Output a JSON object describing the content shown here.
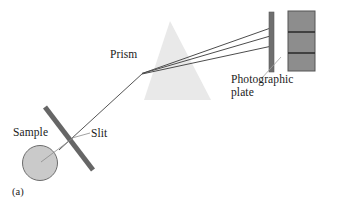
{
  "figure": {
    "caption": "(a)",
    "title_hidden": "",
    "background_color": "#ffffff",
    "labels": {
      "prism": "Prism",
      "photographic_plate": "Photographic\nplate",
      "photographic_plate_line1": "Photographic",
      "photographic_plate_line2": "plate",
      "sample": "Sample",
      "slit": "Slit"
    },
    "colors": {
      "prism_fill": "#e8e8e8",
      "slit_bar": "#666666",
      "sample_fill": "#c9c9c9",
      "sample_stroke": "#6b6b6b",
      "plate_edge_bar": "#6e6e6e",
      "plate_panel_fill": "#8d8d8d",
      "plate_panel_stroke": "#5a5a5a",
      "spectral_line": "#2e2e2e",
      "ray": "#4a4a4a",
      "leader": "#9a9a9a",
      "text": "#1a1a1a"
    },
    "components": {
      "sample": {
        "shape": "circle",
        "cx": 40,
        "cy": 163,
        "r": 17.5
      },
      "slit": {
        "shape": "bar",
        "x1": 45,
        "y1": 107,
        "x2": 93,
        "y2": 170,
        "thickness": 5
      },
      "prism": {
        "shape": "triangle",
        "apex_x": 170,
        "apex_y": 21,
        "base_left_x": 144,
        "base_left_y": 100,
        "base_right_x": 211,
        "base_right_y": 100
      },
      "photographic_plate_bar": {
        "x": 269,
        "y": 12,
        "w": 5,
        "h": 60
      },
      "photographic_plate_panel": {
        "x": 288,
        "y": 11,
        "w": 27,
        "h": 60
      },
      "spectral_lines_y": [
        32,
        53
      ],
      "incident_beam": {
        "x1": 59,
        "y1": 150,
        "x2": 143,
        "y2": 73
      },
      "dispersed_rays": [
        {
          "x1": 143,
          "y1": 73,
          "x2": 271,
          "y2": 28
        },
        {
          "x1": 143,
          "y1": 73,
          "x2": 271,
          "y2": 36
        },
        {
          "x1": 143,
          "y1": 73,
          "x2": 271,
          "y2": 46
        }
      ],
      "leader_lines": [
        {
          "name": "sample-leader",
          "x1": 40,
          "y1": 163,
          "x2": 73,
          "y2": 139
        },
        {
          "name": "slit-leader",
          "x1": 89,
          "y1": 133,
          "x2": 72,
          "y2": 138
        },
        {
          "name": "plate-leader",
          "x1": 262,
          "y1": 78,
          "x2": 280,
          "y2": 58
        }
      ]
    }
  }
}
